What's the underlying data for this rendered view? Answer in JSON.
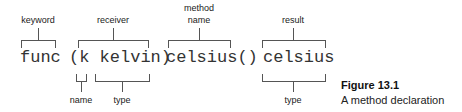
{
  "diagram": {
    "code_tokens": {
      "keyword": "func",
      "receiver": "(k kelvin)",
      "method": "celsius()",
      "result": "celsius"
    },
    "labels_above": {
      "keyword": "keyword",
      "receiver": "receiver",
      "method_line1": "method",
      "method_line2": "name",
      "result": "result"
    },
    "labels_below": {
      "receiver_name": "name",
      "receiver_type": "type",
      "result_type": "type"
    }
  },
  "figure": {
    "number": "Figure 13.1",
    "caption": "A method declaration"
  }
}
